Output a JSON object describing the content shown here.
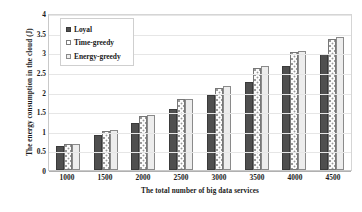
{
  "chart_data": {
    "type": "bar",
    "title": "",
    "xlabel": "The total number of big data services",
    "ylabel": "The energy consumption in the cloud  (J)",
    "categories": [
      "1000",
      "1500",
      "2000",
      "2500",
      "3000",
      "3500",
      "4000",
      "4500"
    ],
    "series": [
      {
        "name": "Loyal",
        "values": [
          0.6,
          0.9,
          1.2,
          1.55,
          1.9,
          2.25,
          2.65,
          2.95
        ]
      },
      {
        "name": "Time-greedy",
        "values": [
          0.66,
          1.0,
          1.38,
          1.8,
          2.1,
          2.6,
          3.0,
          3.35
        ]
      },
      {
        "name": "Energy-greedy",
        "values": [
          0.67,
          1.01,
          1.41,
          1.82,
          2.15,
          2.65,
          3.02,
          3.4
        ]
      }
    ],
    "ylim": [
      0,
      4
    ],
    "yticks": [
      "0",
      "0.5",
      "1",
      "1.5",
      "2",
      "2.5",
      "3",
      "3.5",
      "4"
    ],
    "ytick_values": [
      0,
      0.5,
      1,
      1.5,
      2,
      2.5,
      3,
      3.5,
      4
    ],
    "grid": true,
    "legend_position": "top-left",
    "colors": {
      "loyal": "#4f4f4f",
      "time_greedy": "#fbfbfb",
      "energy_greedy": "#ededed",
      "gridline": "#e6e6e6",
      "axis": "#b0b0b0",
      "text": "#1a1a1a"
    }
  }
}
